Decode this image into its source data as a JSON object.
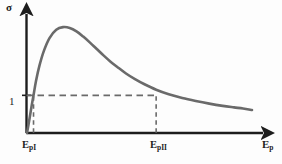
{
  "figure": {
    "background_color": "#fdfdfd",
    "axis_color": "#1d1d1d",
    "curve_color": "#6a6a6a",
    "dash_color": "#6a6a6a",
    "y_axis_label": "σ",
    "x_axis_label_main": "E",
    "x_axis_label_sub": "p",
    "tick_label_y1": "1",
    "tick_label_ep1_main": "E",
    "tick_label_ep1_sub": "pI",
    "tick_label_ep2_main": "E",
    "tick_label_ep2_sub": "pII"
  },
  "chart_data": {
    "type": "line",
    "title": "",
    "subtitle": "",
    "xlabel": "E_p",
    "ylabel": "σ",
    "grid": false,
    "legend": null,
    "legend_position": "none",
    "xlim": [
      0,
      1
    ],
    "ylim": [
      0,
      3.0
    ],
    "x_tick_labels": [
      "E_pI",
      "E_pII"
    ],
    "x_tick_values": [
      0.029,
      0.574
    ],
    "y_tick_labels": [
      "1"
    ],
    "y_tick_values": [
      1.0
    ],
    "series": [
      {
        "name": "secondary electron yield",
        "x": [
          0.0,
          0.01,
          0.02,
          0.029,
          0.04,
          0.055,
          0.075,
          0.1,
          0.13,
          0.16,
          0.19,
          0.22,
          0.25,
          0.28,
          0.31,
          0.34,
          0.37,
          0.4,
          0.44,
          0.48,
          0.52,
          0.574,
          0.63,
          0.69,
          0.75,
          0.81,
          0.87,
          0.92,
          0.96,
          1.0
        ],
        "y": [
          0.0,
          0.34,
          0.7,
          1.0,
          1.38,
          1.78,
          2.18,
          2.52,
          2.74,
          2.81,
          2.79,
          2.7,
          2.56,
          2.4,
          2.23,
          2.06,
          1.9,
          1.76,
          1.58,
          1.43,
          1.3,
          1.15,
          1.03,
          0.93,
          0.85,
          0.78,
          0.72,
          0.68,
          0.65,
          0.61
        ]
      }
    ],
    "annotations": [
      {
        "type": "dashed-horizontal",
        "y": 1.0,
        "x_from": 0.0,
        "x_to": 0.574
      },
      {
        "type": "dashed-vertical",
        "x": 0.029,
        "y_from": 0.0,
        "y_to": 1.0
      },
      {
        "type": "dashed-vertical",
        "x": 0.574,
        "y_from": 0.0,
        "y_to": 1.0
      }
    ]
  }
}
